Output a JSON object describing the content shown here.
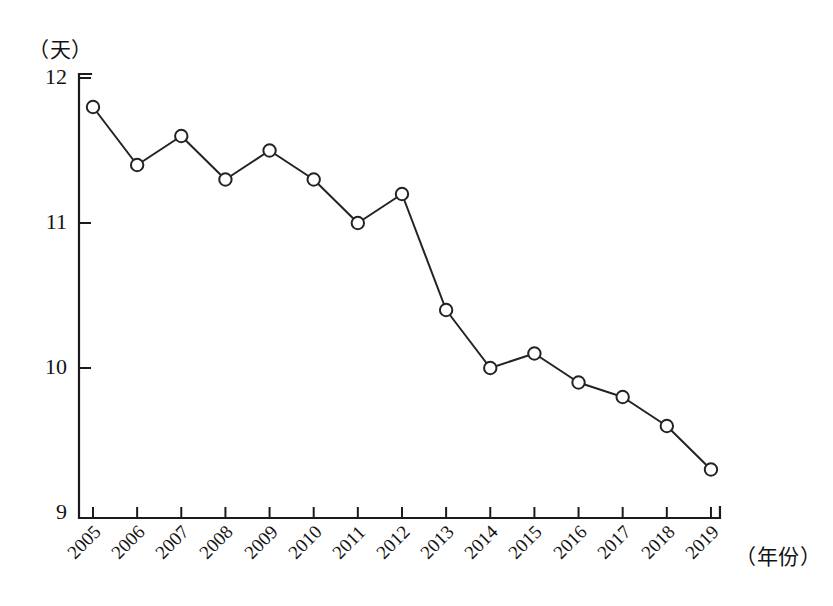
{
  "chart_data": {
    "type": "line",
    "title": "",
    "xlabel": "（年份）",
    "ylabel": "（天）",
    "categories": [
      "2005",
      "2006",
      "2007",
      "2008",
      "2009",
      "2010",
      "2011",
      "2012",
      "2013",
      "2014",
      "2015",
      "2016",
      "2017",
      "2018",
      "2019"
    ],
    "values": [
      11.8,
      11.4,
      11.6,
      11.3,
      11.5,
      11.3,
      11.0,
      11.2,
      10.4,
      10.0,
      10.1,
      9.9,
      9.8,
      9.6,
      9.3
    ],
    "series": [
      {
        "name": "天数",
        "values": [
          11.8,
          11.4,
          11.6,
          11.3,
          11.5,
          11.3,
          11.0,
          11.2,
          10.4,
          10.0,
          10.1,
          9.9,
          9.8,
          9.6,
          9.3
        ]
      }
    ],
    "ylim": [
      9,
      12
    ],
    "yticks": [
      9,
      10,
      11,
      12
    ],
    "ytick_labels": [
      "9",
      "10",
      "11",
      "12"
    ],
    "xlim": [
      "2005",
      "2019"
    ],
    "grid": false,
    "legend": false,
    "legend_position": "none",
    "marker": "open-circle",
    "line_color": "#232323",
    "marker_fill": "#ffffff",
    "background_color": "#ffffff"
  },
  "axes": {
    "y_unit_caption": "（天）",
    "x_unit_caption": "（年份）"
  }
}
